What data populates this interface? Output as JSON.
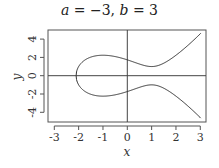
{
  "chart_data": {
    "type": "line",
    "xlabel": "x",
    "ylabel": "y",
    "xlim": [
      -3.25,
      3.25
    ],
    "ylim": [
      -5,
      5
    ],
    "xticks": [
      -3,
      -2,
      -1,
      0,
      1,
      2,
      3
    ],
    "yticks": [
      -4,
      -2,
      0,
      2,
      4
    ],
    "grid": false,
    "reference_lines": {
      "x": 0,
      "y": 0
    },
    "equation": "y^2 = x^3 + a x + b",
    "params": {
      "a": -3,
      "b": 3
    },
    "series": [
      {
        "name": "upper branch",
        "x": [
          -2.1038,
          -2,
          -1.5,
          -1,
          -0.5,
          0,
          0.5,
          1,
          1.5,
          2,
          2.5,
          3
        ],
        "y": [
          0,
          1,
          2.031,
          2.236,
          2.092,
          1.732,
          1.275,
          1,
          1.369,
          2.236,
          3.335,
          4.583
        ]
      },
      {
        "name": "lower branch",
        "x": [
          -2.1038,
          -2,
          -1.5,
          -1,
          -0.5,
          0,
          0.5,
          1,
          1.5,
          2,
          2.5,
          3
        ],
        "y": [
          0,
          -1,
          -2.031,
          -2.236,
          -2.092,
          -1.732,
          -1.275,
          -1,
          -1.369,
          -2.236,
          -3.335,
          -4.583
        ]
      }
    ]
  },
  "labels": {
    "title_a": "a",
    "title_eq1": " = −3, ",
    "title_b": "b",
    "title_eq2": " = 3"
  }
}
